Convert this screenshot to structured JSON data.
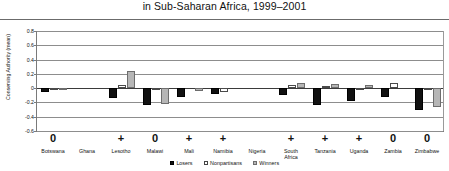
{
  "title": "in Sub-Saharan Africa, 1999–2001",
  "legend": {
    "position": "bottom-center",
    "items": [
      {
        "key": "losers",
        "label": "Losers",
        "color": "#111111"
      },
      {
        "key": "nonpartisans",
        "label": "Nonpartisans",
        "color": "#ffffff"
      },
      {
        "key": "winners",
        "label": "Winners",
        "color": "#b6b6b6"
      }
    ]
  },
  "chart_data": {
    "type": "bar",
    "title": "in Sub-Saharan Africa, 1999–2001",
    "xlabel": "",
    "ylabel": "Conserving Authority (mean)",
    "ylim": [
      -0.6,
      0.8
    ],
    "yticks": [
      "0.8",
      "0.6",
      "0.4",
      "0.2",
      "0",
      "-0.2",
      "-0.4",
      "-0.6"
    ],
    "ytick_values": [
      0.8,
      0.6,
      0.4,
      0.2,
      0,
      -0.2,
      -0.4,
      -0.6
    ],
    "grid": true,
    "categories": [
      "Botswana",
      "Ghana",
      "Lesotho",
      "Malawi",
      "Mali",
      "Namibia",
      "Nigeria",
      "South Africa",
      "Tanzania",
      "Uganda",
      "Zambia",
      "Zimbabwe"
    ],
    "category_lines": [
      [
        "Botswana"
      ],
      [
        "Ghana"
      ],
      [
        "Lesotho"
      ],
      [
        "Malawi"
      ],
      [
        "Mali"
      ],
      [
        "Namibia"
      ],
      [
        "Nigeria"
      ],
      [
        "South",
        "Africa"
      ],
      [
        "Tanzania"
      ],
      [
        "Uganda"
      ],
      [
        "Zambia"
      ],
      [
        "Zimbabwe"
      ]
    ],
    "significance": [
      "0",
      "",
      "+",
      "0",
      "+",
      "+",
      "",
      "+",
      "+",
      "+",
      "0",
      "0"
    ],
    "series": [
      {
        "name": "Losers",
        "key": "losers",
        "color": "#111111",
        "values": [
          -0.06,
          0.0,
          -0.14,
          -0.23,
          -0.13,
          -0.08,
          0.0,
          -0.09,
          -0.24,
          -0.18,
          -0.12,
          -0.3
        ]
      },
      {
        "name": "Nonpartisans",
        "key": "nonpart",
        "color": "#ffffff",
        "values": [
          -0.03,
          0.0,
          0.04,
          -0.01,
          0.0,
          -0.05,
          0.0,
          0.05,
          0.03,
          -0.02,
          0.07,
          -0.01
        ]
      },
      {
        "name": "Winners",
        "key": "winners",
        "color": "#b6b6b6",
        "values": [
          -0.02,
          0.0,
          0.24,
          -0.22,
          -0.04,
          0.0,
          0.0,
          0.07,
          0.06,
          0.05,
          0.0,
          -0.27
        ]
      }
    ]
  }
}
